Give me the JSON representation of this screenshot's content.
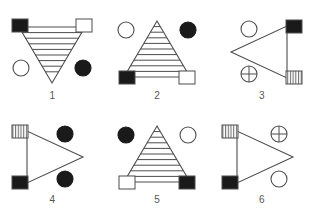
{
  "page": {
    "background_color": "#ffffff",
    "stroke_color": "#4d4d4d",
    "fill_black": "#1a1a1a",
    "fill_white": "#ffffff",
    "caption_color": "#555555"
  },
  "figures": [
    {
      "id": "figure-1",
      "caption": "1",
      "triangle": {
        "orientation": "down",
        "fill": "striped-horizontal",
        "stripe_count": 8
      },
      "markers": [
        {
          "position": "top-left",
          "shape": "square",
          "fill": "black"
        },
        {
          "position": "top-right",
          "shape": "square",
          "fill": "white"
        },
        {
          "position": "bottom-left",
          "shape": "circle",
          "fill": "white"
        },
        {
          "position": "bottom-right",
          "shape": "circle",
          "fill": "black"
        }
      ]
    },
    {
      "id": "figure-2",
      "caption": "2",
      "triangle": {
        "orientation": "up",
        "fill": "striped-horizontal",
        "stripe_count": 8
      },
      "markers": [
        {
          "position": "top-left",
          "shape": "circle",
          "fill": "white"
        },
        {
          "position": "top-right",
          "shape": "circle",
          "fill": "black"
        },
        {
          "position": "bottom-left",
          "shape": "square",
          "fill": "black"
        },
        {
          "position": "bottom-right",
          "shape": "square",
          "fill": "white"
        }
      ]
    },
    {
      "id": "figure-3",
      "caption": "3",
      "triangle": {
        "orientation": "left",
        "fill": "none",
        "stripe_count": 0
      },
      "markers": [
        {
          "position": "top-left",
          "shape": "circle",
          "fill": "white"
        },
        {
          "position": "top-right",
          "shape": "square",
          "fill": "black"
        },
        {
          "position": "bottom-left",
          "shape": "circle",
          "fill": "crosshair"
        },
        {
          "position": "bottom-right",
          "shape": "square",
          "fill": "striped-vertical"
        }
      ]
    },
    {
      "id": "figure-4",
      "caption": "4",
      "triangle": {
        "orientation": "right",
        "fill": "none",
        "stripe_count": 0
      },
      "markers": [
        {
          "position": "top-left",
          "shape": "square",
          "fill": "striped-vertical"
        },
        {
          "position": "top-right",
          "shape": "circle",
          "fill": "black"
        },
        {
          "position": "bottom-left",
          "shape": "square",
          "fill": "black"
        },
        {
          "position": "bottom-right",
          "shape": "circle",
          "fill": "black"
        }
      ]
    },
    {
      "id": "figure-5",
      "caption": "5",
      "triangle": {
        "orientation": "up",
        "fill": "striped-horizontal",
        "stripe_count": 8
      },
      "markers": [
        {
          "position": "top-left",
          "shape": "circle",
          "fill": "black"
        },
        {
          "position": "top-right",
          "shape": "circle",
          "fill": "white"
        },
        {
          "position": "bottom-left",
          "shape": "square",
          "fill": "white"
        },
        {
          "position": "bottom-right",
          "shape": "square",
          "fill": "black"
        }
      ]
    },
    {
      "id": "figure-6",
      "caption": "6",
      "triangle": {
        "orientation": "right",
        "fill": "none",
        "stripe_count": 0
      },
      "markers": [
        {
          "position": "top-left",
          "shape": "square",
          "fill": "striped-vertical"
        },
        {
          "position": "top-right",
          "shape": "circle",
          "fill": "crosshair"
        },
        {
          "position": "bottom-left",
          "shape": "square",
          "fill": "black"
        },
        {
          "position": "bottom-right",
          "shape": "circle",
          "fill": "white"
        }
      ]
    }
  ]
}
